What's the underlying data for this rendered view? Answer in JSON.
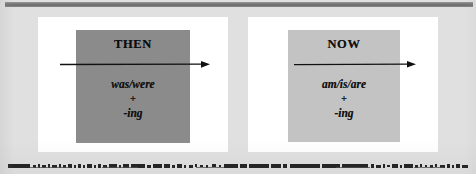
{
  "slide": {
    "title": "Past Continuous vs Present Continuous",
    "background_color": "#e0e0e0",
    "width": 476,
    "height": 174
  },
  "top_rule": {
    "color": "#787878"
  },
  "panels": [
    {
      "id": "then",
      "panel_color": "#ffffff",
      "box_color": "#8b8b8b",
      "title": "THEN",
      "formula": {
        "verb": "was/were",
        "operator": "+",
        "suffix": "-ing"
      },
      "arrow": {
        "name": "timeline-arrow-right",
        "color": "#111111",
        "direction": "right"
      }
    },
    {
      "id": "now",
      "panel_color": "#ffffff",
      "box_color": "#c3c3c3",
      "title": "NOW",
      "formula": {
        "verb": "am/is/are",
        "operator": "+",
        "suffix": "-ing"
      },
      "arrow": {
        "name": "timeline-arrow-right",
        "color": "#111111",
        "direction": "right"
      }
    }
  ],
  "footer": {
    "note": "",
    "appearance": "illegible degraded scan artifact band"
  }
}
